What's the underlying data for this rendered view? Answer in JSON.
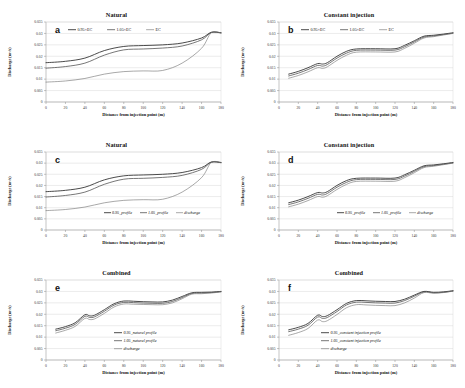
{
  "figure": {
    "panels": [
      {
        "letter": "a",
        "title": "Natural",
        "xlabel": "Distance from injection point (m)",
        "ylabel": "Discharge (m³/s)",
        "legend": [
          "0.95×EC",
          "1.05×EC",
          "EC"
        ],
        "legend_pos": "top",
        "yticks": [
          "0",
          "0.005",
          "0.01",
          "0.015",
          "0.02",
          "0.025",
          "0.03",
          "0.035"
        ],
        "xticks": [
          "0",
          "20",
          "40",
          "60",
          "80",
          "100",
          "120",
          "140",
          "160",
          "180"
        ]
      },
      {
        "letter": "b",
        "title": "Constant injection",
        "xlabel": "Distance from injection point (m)",
        "ylabel": "Discharge (m³/s)",
        "legend": [
          "0.95×EC",
          "1.05×EC",
          "EC"
        ],
        "legend_pos": "top",
        "yticks": [
          "0",
          "0.005",
          "0.01",
          "0.015",
          "0.02",
          "0.025",
          "0.03",
          "0.035"
        ],
        "xticks": [
          "0",
          "20",
          "40",
          "60",
          "80",
          "100",
          "120",
          "140",
          "160",
          "180"
        ]
      },
      {
        "letter": "c",
        "title": "Natural",
        "xlabel": "Distance from injection point (m)",
        "ylabel": "Discharge (m³/s)",
        "legend": [
          "0.95_profile",
          "1.05_profile",
          "discharge"
        ],
        "legend_pos": "inner",
        "yticks": [
          "0",
          "0.005",
          "0.01",
          "0.015",
          "0.02",
          "0.025",
          "0.03",
          "0.035"
        ],
        "xticks": [
          "0",
          "20",
          "40",
          "60",
          "80",
          "100",
          "120",
          "140",
          "160",
          "180"
        ]
      },
      {
        "letter": "d",
        "title": "Constant injection",
        "xlabel": "Distance from injection point (m)",
        "ylabel": "Discharge (m³/s)",
        "legend": [
          "0.95_profile",
          "1.05_profile",
          "discharge"
        ],
        "legend_pos": "inner",
        "yticks": [
          "0",
          "0.005",
          "0.01",
          "0.015",
          "0.02",
          "0.025",
          "0.03",
          "0.035"
        ],
        "xticks": [
          "0",
          "20",
          "40",
          "60",
          "80",
          "100",
          "120",
          "140",
          "160",
          "180"
        ]
      },
      {
        "letter": "e",
        "title": "Combined",
        "xlabel": "Distance from injection point (m)",
        "ylabel": "Discharge (m³/s)",
        "legend": [
          "0.95_natural profile",
          "1.05_natural profile",
          "discharge"
        ],
        "legend_pos": "stack",
        "yticks": [
          "0",
          "0.005",
          "0.01",
          "0.015",
          "0.02",
          "0.025",
          "0.03",
          "0.035"
        ],
        "xticks": [
          "0",
          "20",
          "40",
          "60",
          "80",
          "100",
          "120",
          "140",
          "160",
          "180"
        ]
      },
      {
        "letter": "f",
        "title": "Combined",
        "xlabel": "Distance from injection point (m)",
        "ylabel": "Discharge (m³/s)",
        "legend": [
          "0.95_constant injection profile",
          "1.05_constant injection profile",
          "discharge"
        ],
        "legend_pos": "stack",
        "yticks": [
          "0",
          "0.005",
          "0.01",
          "0.015",
          "0.02",
          "0.025",
          "0.03",
          "0.035"
        ],
        "xticks": [
          "0",
          "20",
          "40",
          "60",
          "80",
          "100",
          "120",
          "140",
          "160",
          "180"
        ]
      }
    ]
  },
  "colors": {
    "series_dark": "#2b2b2b",
    "series_mid": "#6e6e6e",
    "series_light": "#4a4a4a",
    "grid": "#cfcfcf",
    "axis": "#8a8a8a"
  },
  "chart_data": [
    {
      "type": "line",
      "panel": "a",
      "title": "Natural",
      "xlabel": "Distance from injection point (m)",
      "ylabel": "Discharge (m³/s)",
      "xlim": [
        0,
        180
      ],
      "ylim": [
        0,
        0.035
      ],
      "grid": true,
      "legend_position": "top-inside",
      "x": [
        0,
        20,
        40,
        60,
        80,
        100,
        120,
        140,
        160,
        170,
        180
      ],
      "series": [
        {
          "name": "0.95×EC",
          "values": [
            0.0172,
            0.0178,
            0.0192,
            0.0225,
            0.0243,
            0.0247,
            0.025,
            0.0258,
            0.028,
            0.0305,
            0.0303
          ]
        },
        {
          "name": "1.05×EC",
          "values": [
            0.0148,
            0.0155,
            0.017,
            0.0205,
            0.0228,
            0.0232,
            0.0236,
            0.0245,
            0.0272,
            0.0304,
            0.0302
          ]
        },
        {
          "name": "EC",
          "values": [
            0.0087,
            0.0092,
            0.0103,
            0.0122,
            0.0133,
            0.0136,
            0.0138,
            0.017,
            0.0235,
            0.0303,
            0.0302
          ]
        }
      ]
    },
    {
      "type": "line",
      "panel": "b",
      "title": "Constant injection",
      "xlabel": "Distance from injection point (m)",
      "ylabel": "Discharge (m³/s)",
      "xlim": [
        0,
        180
      ],
      "ylim": [
        0,
        0.035
      ],
      "grid": true,
      "legend_position": "top-inside",
      "x": [
        10,
        20,
        30,
        40,
        45,
        50,
        60,
        70,
        80,
        100,
        120,
        130,
        140,
        150,
        160,
        170,
        180
      ],
      "series": [
        {
          "name": "0.95×EC",
          "values": [
            0.0122,
            0.0134,
            0.015,
            0.0168,
            0.0166,
            0.0172,
            0.02,
            0.0222,
            0.0232,
            0.0233,
            0.0233,
            0.0248,
            0.0268,
            0.0288,
            0.0292,
            0.0297,
            0.0303
          ]
        },
        {
          "name": "1.05×EC",
          "values": [
            0.0114,
            0.0126,
            0.0142,
            0.016,
            0.0157,
            0.0164,
            0.0192,
            0.0214,
            0.0226,
            0.0227,
            0.0227,
            0.0242,
            0.0263,
            0.0284,
            0.0289,
            0.0295,
            0.0301
          ]
        },
        {
          "name": "EC",
          "values": [
            0.0104,
            0.0116,
            0.0132,
            0.015,
            0.0147,
            0.0154,
            0.0182,
            0.0205,
            0.0218,
            0.0219,
            0.0219,
            0.0235,
            0.0257,
            0.028,
            0.0286,
            0.0293,
            0.03
          ]
        }
      ]
    },
    {
      "type": "line",
      "panel": "c",
      "title": "Natural",
      "xlabel": "Distance from injection point (m)",
      "ylabel": "Discharge (m³/s)",
      "xlim": [
        0,
        180
      ],
      "ylim": [
        0,
        0.035
      ],
      "grid": true,
      "legend_position": "inner-bottom",
      "x": [
        0,
        20,
        40,
        60,
        80,
        100,
        120,
        140,
        160,
        170,
        180
      ],
      "series": [
        {
          "name": "0.95_profile",
          "values": [
            0.0172,
            0.0178,
            0.0192,
            0.0225,
            0.0243,
            0.0247,
            0.025,
            0.0258,
            0.028,
            0.0305,
            0.0303
          ]
        },
        {
          "name": "1.05_profile",
          "values": [
            0.0148,
            0.0155,
            0.017,
            0.0205,
            0.0228,
            0.0232,
            0.0236,
            0.0245,
            0.0272,
            0.0304,
            0.0302
          ]
        },
        {
          "name": "discharge",
          "values": [
            0.0087,
            0.0092,
            0.0103,
            0.0122,
            0.0133,
            0.0136,
            0.0138,
            0.017,
            0.0235,
            0.0303,
            0.0302
          ]
        }
      ]
    },
    {
      "type": "line",
      "panel": "d",
      "title": "Constant injection",
      "xlabel": "Distance from injection point (m)",
      "ylabel": "Discharge (m³/s)",
      "xlim": [
        0,
        180
      ],
      "ylim": [
        0,
        0.035
      ],
      "grid": true,
      "legend_position": "inner-bottom",
      "x": [
        10,
        20,
        30,
        40,
        45,
        50,
        60,
        70,
        80,
        100,
        120,
        130,
        140,
        150,
        160,
        170,
        180
      ],
      "series": [
        {
          "name": "0.95_profile",
          "values": [
            0.0122,
            0.0134,
            0.015,
            0.0168,
            0.0166,
            0.0172,
            0.02,
            0.0222,
            0.0232,
            0.0233,
            0.0233,
            0.0248,
            0.0268,
            0.0288,
            0.0292,
            0.0297,
            0.0303
          ]
        },
        {
          "name": "1.05_profile",
          "values": [
            0.0114,
            0.0126,
            0.0142,
            0.016,
            0.0157,
            0.0164,
            0.0192,
            0.0214,
            0.0226,
            0.0227,
            0.0227,
            0.0242,
            0.0263,
            0.0284,
            0.0289,
            0.0295,
            0.0301
          ]
        },
        {
          "name": "discharge",
          "values": [
            0.0104,
            0.0116,
            0.0132,
            0.015,
            0.0147,
            0.0154,
            0.0182,
            0.0205,
            0.0218,
            0.0219,
            0.0219,
            0.0235,
            0.0257,
            0.028,
            0.0286,
            0.0293,
            0.03
          ]
        }
      ]
    },
    {
      "type": "line",
      "panel": "e",
      "title": "Combined",
      "xlabel": "Distance from injection point (m)",
      "ylabel": "Discharge (m³/s)",
      "xlim": [
        0,
        180
      ],
      "ylim": [
        0,
        0.035
      ],
      "grid": true,
      "legend_position": "inner-right",
      "x": [
        10,
        20,
        30,
        40,
        45,
        50,
        60,
        70,
        80,
        90,
        100,
        110,
        120,
        130,
        140,
        150,
        160,
        170,
        180
      ],
      "series": [
        {
          "name": "0.95_natural profile",
          "values": [
            0.0135,
            0.0146,
            0.0163,
            0.0198,
            0.0193,
            0.0196,
            0.022,
            0.0246,
            0.0258,
            0.0257,
            0.0255,
            0.0254,
            0.0254,
            0.0262,
            0.0278,
            0.0294,
            0.0296,
            0.0297,
            0.03
          ]
        },
        {
          "name": "1.05_natural profile",
          "values": [
            0.0128,
            0.0139,
            0.0156,
            0.0191,
            0.0186,
            0.0189,
            0.0213,
            0.024,
            0.0252,
            0.0251,
            0.0249,
            0.0248,
            0.0248,
            0.0256,
            0.0273,
            0.0291,
            0.0293,
            0.0295,
            0.0299
          ]
        },
        {
          "name": "discharge",
          "values": [
            0.0118,
            0.013,
            0.0147,
            0.0182,
            0.0177,
            0.018,
            0.0204,
            0.0232,
            0.0245,
            0.0244,
            0.0243,
            0.0242,
            0.0242,
            0.025,
            0.0268,
            0.0288,
            0.029,
            0.0293,
            0.0298
          ]
        }
      ]
    },
    {
      "type": "line",
      "panel": "f",
      "title": "Combined",
      "xlabel": "Distance from injection point (m)",
      "ylabel": "Discharge (m³/s)",
      "xlim": [
        0,
        180
      ],
      "ylim": [
        0,
        0.035
      ],
      "grid": true,
      "legend_position": "inner-center",
      "x": [
        10,
        20,
        30,
        40,
        45,
        50,
        60,
        70,
        80,
        90,
        100,
        110,
        120,
        130,
        140,
        150,
        160,
        170,
        180
      ],
      "series": [
        {
          "name": "0.95_constant injection profile",
          "values": [
            0.0132,
            0.0143,
            0.016,
            0.0196,
            0.019,
            0.0194,
            0.022,
            0.0248,
            0.026,
            0.0259,
            0.0257,
            0.0256,
            0.0256,
            0.0266,
            0.0284,
            0.03,
            0.0296,
            0.0298,
            0.0303
          ]
        },
        {
          "name": "1.05_constant injection profile",
          "values": [
            0.0124,
            0.0135,
            0.0152,
            0.0188,
            0.0182,
            0.0186,
            0.0212,
            0.0241,
            0.0253,
            0.0252,
            0.025,
            0.0249,
            0.0249,
            0.026,
            0.0279,
            0.0298,
            0.0294,
            0.0296,
            0.0302
          ]
        },
        {
          "name": "discharge",
          "values": [
            0.0108,
            0.012,
            0.0138,
            0.0175,
            0.0168,
            0.0172,
            0.0199,
            0.0229,
            0.0242,
            0.0241,
            0.0239,
            0.0238,
            0.0238,
            0.025,
            0.0271,
            0.0295,
            0.0292,
            0.0295,
            0.0301
          ]
        }
      ]
    }
  ]
}
